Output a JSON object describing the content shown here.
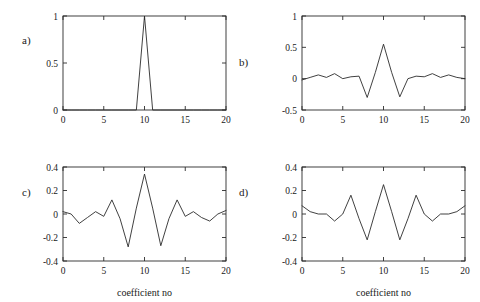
{
  "figure": {
    "background_color": "#ffffff",
    "line_color": "#2b2b2b",
    "panel_count": 4
  },
  "panels": {
    "a": {
      "label": "a)",
      "xlabel": "",
      "ylabel": ""
    },
    "b": {
      "label": "b)",
      "xlabel": "",
      "ylabel": ""
    },
    "c": {
      "label": "c)",
      "xlabel": "coefficient no",
      "ylabel": ""
    },
    "d": {
      "label": "d)",
      "xlabel": "coefficient no",
      "ylabel": ""
    }
  },
  "chart_data": [
    {
      "type": "line",
      "panel": "a",
      "title": "",
      "xlabel": "",
      "ylabel": "",
      "xlim": [
        0,
        20
      ],
      "ylim": [
        0,
        1
      ],
      "xticks": [
        0,
        5,
        10,
        15,
        20
      ],
      "xticklabels": [
        "0",
        "5",
        "10",
        "15",
        "20"
      ],
      "yticks": [
        0,
        0.5,
        1
      ],
      "yticklabels": [
        "0",
        "0.5",
        "1"
      ],
      "grid": false,
      "legend": false,
      "x": [
        0,
        1,
        2,
        3,
        4,
        5,
        6,
        7,
        8,
        9,
        10,
        11,
        12,
        13,
        14,
        15,
        16,
        17,
        18,
        19,
        20
      ],
      "values": [
        0,
        0,
        0,
        0,
        0,
        0,
        0,
        0,
        0,
        0,
        1,
        0,
        0,
        0,
        0,
        0,
        0,
        0,
        0,
        0,
        0
      ]
    },
    {
      "type": "line",
      "panel": "b",
      "title": "",
      "xlabel": "",
      "ylabel": "",
      "xlim": [
        0,
        20
      ],
      "ylim": [
        -0.5,
        1
      ],
      "xticks": [
        0,
        5,
        10,
        15,
        20
      ],
      "xticklabels": [
        "0",
        "5",
        "10",
        "15",
        "20"
      ],
      "yticks": [
        -0.5,
        0,
        0.5,
        1
      ],
      "yticklabels": [
        "-0.5",
        "0",
        "0.5",
        "1"
      ],
      "grid": false,
      "legend": false,
      "x": [
        0,
        1,
        2,
        3,
        4,
        5,
        6,
        7,
        8,
        9,
        10,
        11,
        12,
        13,
        14,
        15,
        16,
        17,
        18,
        19,
        20
      ],
      "values": [
        -0.02,
        0.02,
        0.06,
        0.02,
        0.08,
        0.0,
        0.03,
        0.04,
        -0.3,
        0.1,
        0.55,
        0.1,
        -0.29,
        0.0,
        0.04,
        0.03,
        0.08,
        0.02,
        0.06,
        0.02,
        0.0
      ]
    },
    {
      "type": "line",
      "panel": "c",
      "title": "",
      "xlabel": "coefficient no",
      "ylabel": "",
      "xlim": [
        0,
        20
      ],
      "ylim": [
        -0.4,
        0.4
      ],
      "xticks": [
        0,
        5,
        10,
        15,
        20
      ],
      "xticklabels": [
        "0",
        "5",
        "10",
        "15",
        "20"
      ],
      "yticks": [
        -0.4,
        -0.2,
        0,
        0.2,
        0.4
      ],
      "yticklabels": [
        "-0.4",
        "-0.2",
        "0",
        "0.2",
        "0.4"
      ],
      "grid": false,
      "legend": false,
      "x": [
        0,
        1,
        2,
        3,
        4,
        5,
        6,
        7,
        8,
        9,
        10,
        11,
        12,
        13,
        14,
        15,
        16,
        17,
        18,
        19,
        20
      ],
      "values": [
        0.02,
        0.0,
        -0.08,
        -0.03,
        0.02,
        -0.02,
        0.12,
        -0.04,
        -0.28,
        0.05,
        0.34,
        0.05,
        -0.27,
        -0.04,
        0.12,
        -0.02,
        0.02,
        -0.03,
        -0.06,
        0.0,
        0.03
      ]
    },
    {
      "type": "line",
      "panel": "d",
      "title": "",
      "xlabel": "coefficient no",
      "ylabel": "",
      "xlim": [
        0,
        20
      ],
      "ylim": [
        -0.4,
        0.4
      ],
      "xticks": [
        0,
        5,
        10,
        15,
        20
      ],
      "xticklabels": [
        "0",
        "5",
        "10",
        "15",
        "20"
      ],
      "yticks": [
        -0.4,
        -0.2,
        0,
        0.2,
        0.4
      ],
      "yticklabels": [
        "-0.4",
        "-0.2",
        "0",
        "0.2",
        "0.4"
      ],
      "grid": false,
      "legend": false,
      "x": [
        0,
        1,
        2,
        3,
        4,
        5,
        6,
        7,
        8,
        9,
        10,
        11,
        12,
        13,
        14,
        15,
        16,
        17,
        18,
        19,
        20
      ],
      "values": [
        0.07,
        0.02,
        0.0,
        0.0,
        -0.06,
        0.0,
        0.16,
        -0.04,
        -0.22,
        0.02,
        0.25,
        0.02,
        -0.22,
        -0.04,
        0.16,
        0.0,
        -0.06,
        0.0,
        0.0,
        0.02,
        0.07
      ]
    }
  ]
}
